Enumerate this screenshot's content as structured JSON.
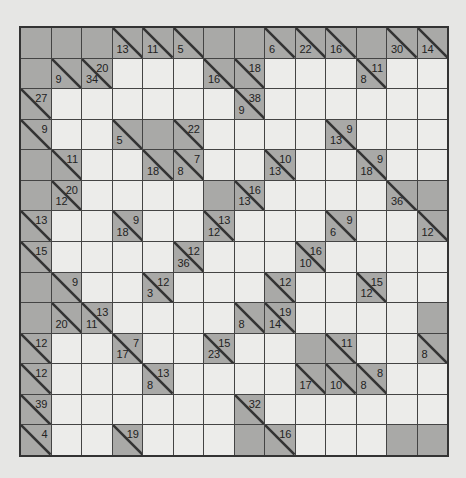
{
  "puzzle": {
    "type": "kakuro",
    "rows": 14,
    "cols": 14,
    "colors": {
      "block": "#a9a9a7",
      "white": "#ececea",
      "grid_line": "#444444",
      "background": "#e6e6e4"
    },
    "legend": "Each row lists cells left-to-right. 'X' = blocked, 'W' = empty white cell, object = clue cell with 'd' (down sum) and/or 'r' (right/across sum).",
    "grid": [
      [
        "X",
        "X",
        "X",
        {
          "d": 13
        },
        {
          "d": 11
        },
        {
          "d": 5
        },
        "X",
        "X",
        {
          "d": 6
        },
        {
          "d": 22
        },
        {
          "d": 16
        },
        "X",
        {
          "d": 30
        },
        {
          "d": 14
        }
      ],
      [
        "X",
        {
          "d": 9
        },
        {
          "r": 20,
          "d": 34
        },
        "W",
        "W",
        "W",
        {
          "d": 16
        },
        {
          "r": 18
        },
        "W",
        "W",
        "W",
        {
          "r": 11,
          "d": 8
        },
        "W",
        "W"
      ],
      [
        {
          "r": 27
        },
        "W",
        "W",
        "W",
        "W",
        "W",
        "W",
        {
          "r": 38,
          "d": 9
        },
        "W",
        "W",
        "W",
        "W",
        "W",
        "W"
      ],
      [
        {
          "r": 9
        },
        "W",
        "W",
        {
          "d": 5
        },
        "X",
        {
          "r": 22
        },
        "W",
        "W",
        "W",
        "W",
        {
          "r": 9,
          "d": 13
        },
        "W",
        "W",
        "W"
      ],
      [
        "X",
        {
          "r": 11
        },
        "W",
        "W",
        {
          "d": 18
        },
        {
          "r": 7,
          "d": 8
        },
        "W",
        "W",
        {
          "r": 10,
          "d": 13
        },
        "W",
        "W",
        {
          "r": 9,
          "d": 18
        },
        "W",
        "W"
      ],
      [
        "X",
        {
          "r": 20,
          "d": 12
        },
        "W",
        "W",
        "W",
        "W",
        "X",
        {
          "r": 16,
          "d": 13
        },
        "W",
        "W",
        "W",
        "W",
        {
          "d": 36
        },
        "X"
      ],
      [
        {
          "r": 13
        },
        "W",
        "W",
        {
          "r": 9,
          "d": 18
        },
        "W",
        "W",
        {
          "r": 13,
          "d": 12
        },
        "W",
        "W",
        "W",
        {
          "r": 9,
          "d": 6
        },
        "W",
        "W",
        {
          "d": 12
        }
      ],
      [
        {
          "r": 15
        },
        "W",
        "W",
        "W",
        "W",
        {
          "r": 12,
          "d": 36
        },
        "W",
        "W",
        "W",
        {
          "r": 16,
          "d": 10
        },
        "W",
        "W",
        "W",
        "W"
      ],
      [
        "X",
        {
          "r": 9
        },
        "W",
        "W",
        {
          "r": 12,
          "d": 3
        },
        "W",
        "W",
        "W",
        {
          "r": 12
        },
        "W",
        "W",
        {
          "r": 15,
          "d": 12
        },
        "W",
        "W"
      ],
      [
        "X",
        {
          "d": 20
        },
        {
          "r": 13,
          "d": 11
        },
        "W",
        "W",
        "W",
        "W",
        {
          "d": 8
        },
        {
          "r": 19,
          "d": 14
        },
        "W",
        "W",
        "W",
        "W",
        "X"
      ],
      [
        {
          "r": 12
        },
        "W",
        "W",
        {
          "r": 7,
          "d": 17
        },
        "W",
        "W",
        {
          "r": 15,
          "d": 23
        },
        "W",
        "W",
        "X",
        {
          "r": 11
        },
        "W",
        "W",
        {
          "d": 8
        }
      ],
      [
        {
          "r": 12
        },
        "W",
        "W",
        "W",
        {
          "r": 13,
          "d": 8
        },
        "W",
        "W",
        "W",
        "W",
        {
          "d": 17
        },
        {
          "d": 10
        },
        {
          "r": 8,
          "d": 8
        },
        "W",
        "W"
      ],
      [
        {
          "r": 39
        },
        "W",
        "W",
        "W",
        "W",
        "W",
        "W",
        {
          "r": 32
        },
        "W",
        "W",
        "W",
        "W",
        "W",
        "W"
      ],
      [
        {
          "r": 4
        },
        "W",
        "W",
        {
          "r": 19
        },
        "W",
        "W",
        "W",
        "X",
        {
          "r": 16
        },
        "W",
        "W",
        "W",
        "X",
        "X"
      ]
    ]
  }
}
